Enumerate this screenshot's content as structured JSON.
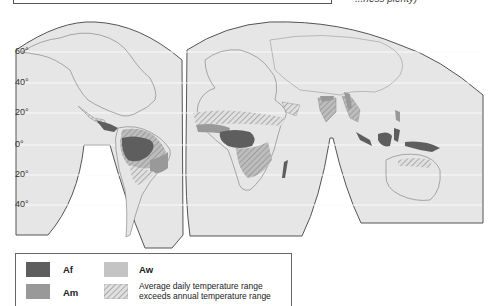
{
  "header": {
    "clipped_note": "...ness plenty)"
  },
  "map": {
    "type": "climate-zone world map (interrupted projection)",
    "latitude_labels": [
      "60°",
      "40°",
      "20°",
      "0°",
      "20°",
      "40°"
    ],
    "colors": {
      "ocean_land_bg": "#e6e6e6",
      "Af": "#5e5e5e",
      "Am": "#999999",
      "Aw": "#c4c4c4",
      "outline": "#555555"
    }
  },
  "legend": {
    "items": [
      {
        "code": "Af",
        "label": "Af",
        "color": "#5e5e5e"
      },
      {
        "code": "Am",
        "label": "Am",
        "color": "#999999"
      },
      {
        "code": "Aw",
        "label": "Aw",
        "color": "#c4c4c4"
      },
      {
        "code": "hatch",
        "label_line1": "Average daily temperature range",
        "label_line2": "exceeds annual temperature range",
        "pattern": "diagonal-hatch"
      }
    ]
  }
}
